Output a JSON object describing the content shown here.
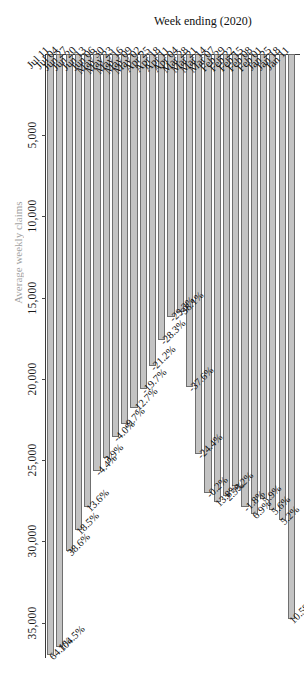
{
  "chart_data": {
    "type": "bar",
    "orientation": "vertical-rotated",
    "title": "",
    "xlabel": "Week ending (2020)",
    "ylabel": "Average weekly claims",
    "ylim": [
      0,
      37000
    ],
    "yticks": [
      35000,
      30000,
      25000,
      20000,
      15000,
      10000,
      5000
    ],
    "ytick_labels": [
      "35,000",
      "30,000",
      "25,000",
      "20,000",
      "15,000",
      "10,000",
      "5,000"
    ],
    "grid": false,
    "categories": [
      "Jan 11",
      "Jan 18",
      "Jan 25",
      "Feb 01",
      "Feb 08",
      "Feb 15",
      "Feb 22",
      "Feb 29",
      "Mar 07",
      "Mar 14",
      "Mar 21",
      "Mar 28",
      "Apr 04",
      "Apr 11",
      "Apr 18",
      "Apr 25",
      "May 02",
      "May 09",
      "May 16",
      "May 23",
      "May 30",
      "Jun 06",
      "Jun 13",
      "Jun 20",
      "Jun 27",
      "Jul 04",
      "Jul 11"
    ],
    "values": [
      34800,
      28700,
      28100,
      27400,
      28300,
      27900,
      26600,
      27200,
      27600,
      27000,
      24600,
      20500,
      15900,
      16200,
      17600,
      19200,
      20600,
      21800,
      22800,
      23600,
      24900,
      25700,
      27900,
      29300,
      30600,
      36500,
      37000
    ],
    "data_labels": [
      "10.5%",
      "5.2%",
      "5.6%",
      "5.9%",
      "6.9%",
      "-1.8%",
      "3.2%",
      "2.5%",
      "13.8%",
      "-0.2%",
      "-24.4%",
      "-37.6%",
      "-38.1%",
      "-29.3%",
      "-28.3%",
      "-21.2%",
      "-19.7%",
      "-12.7%",
      "-9.7%",
      "-4.0%",
      "3.9%",
      "-4.4%",
      "13.6%",
      "18.5%",
      "38.6%",
      "104.5%",
      "64.1%"
    ],
    "label_note": "Percent change versus prior year, printed at each bar tip"
  },
  "colors": {
    "bar_fill": "#c3c3c3",
    "bar_stroke": "#6f6f6f",
    "axis": "#3a3a3a",
    "text": "#111111"
  }
}
